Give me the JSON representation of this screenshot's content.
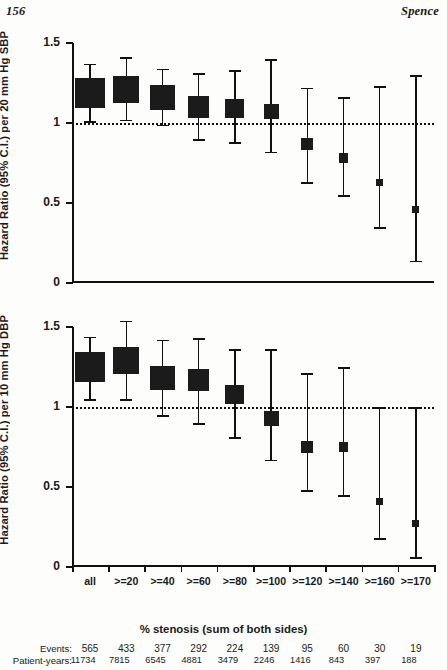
{
  "running_head": {
    "page_number": "156",
    "author": "Spence"
  },
  "figure": {
    "x_axis": {
      "title": "% stenosis (sum of both sides)",
      "categories": [
        "all",
        ">=20",
        ">=40",
        ">=60",
        ">=80",
        ">=100",
        ">=120",
        ">=140",
        ">=160",
        ">=170"
      ]
    },
    "counts": {
      "events_label": "Events:",
      "patient_years_label": "Patient-years:",
      "events": [
        "565",
        "433",
        "377",
        "292",
        "224",
        "139",
        "95",
        "60",
        "30",
        "19"
      ],
      "patient_years": [
        "11734",
        "7815",
        "6545",
        "4881",
        "3479",
        "2246",
        "1416",
        "843",
        "397",
        "188",
        ""
      ]
    }
  },
  "chart_data": [
    {
      "type": "scatter",
      "panel": "top",
      "title": "",
      "xlabel": "% stenosis (sum of both sides)",
      "ylabel": "Hazard Ratio (95% C.I.) per 20 mm Hg SBP",
      "ylim": [
        0,
        1.5
      ],
      "yticks": [
        0,
        0.5,
        1,
        1.5
      ],
      "ytick_labels": [
        "0",
        "0.5",
        "1",
        "1.5"
      ],
      "grid": false,
      "reference_line": 1.0,
      "reference_line_style": "dotted",
      "categories": [
        "all",
        ">=20",
        ">=40",
        ">=60",
        ">=80",
        ">=100",
        ">=120",
        ">=140",
        ">=160",
        ">=170"
      ],
      "values": [
        1.19,
        1.21,
        1.16,
        1.1,
        1.09,
        1.07,
        0.87,
        0.78,
        0.63,
        0.46
      ],
      "ci_low": [
        1.01,
        1.02,
        0.99,
        0.9,
        0.88,
        0.82,
        0.63,
        0.55,
        0.35,
        0.14
      ],
      "ci_high": [
        1.37,
        1.41,
        1.34,
        1.31,
        1.33,
        1.4,
        1.22,
        1.16,
        1.23,
        1.3
      ],
      "marker_weights": [
        565,
        433,
        377,
        292,
        224,
        139,
        95,
        60,
        30,
        19
      ]
    },
    {
      "type": "scatter",
      "panel": "bottom",
      "title": "",
      "xlabel": "% stenosis (sum of both sides)",
      "ylabel": "Hazard Ratio (95% C.I.) per 10 mm Hg DBP",
      "ylim": [
        0,
        1.5
      ],
      "yticks": [
        0,
        0.5,
        1,
        1.5
      ],
      "ytick_labels": [
        "0",
        "0.5",
        "1",
        "1.5"
      ],
      "grid": false,
      "reference_line": 1.0,
      "reference_line_style": "dotted",
      "categories": [
        "all",
        ">=20",
        ">=40",
        ">=60",
        ">=80",
        ">=100",
        ">=120",
        ">=140",
        ">=160",
        ">=170"
      ],
      "values": [
        1.25,
        1.29,
        1.18,
        1.17,
        1.08,
        0.93,
        0.75,
        0.75,
        0.41,
        0.27
      ],
      "ci_low": [
        1.05,
        1.05,
        0.95,
        0.9,
        0.81,
        0.67,
        0.48,
        0.45,
        0.18,
        0.06
      ],
      "ci_high": [
        1.44,
        1.54,
        1.42,
        1.43,
        1.36,
        1.36,
        1.21,
        1.25,
        1.0,
        1.0
      ],
      "marker_weights": [
        565,
        433,
        377,
        292,
        224,
        139,
        95,
        60,
        30,
        19
      ]
    }
  ]
}
